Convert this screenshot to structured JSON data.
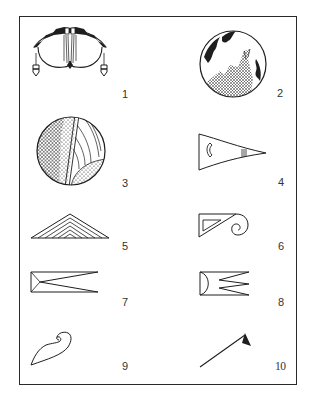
{
  "plate": {
    "figures": [
      {
        "number": "1",
        "motif": "winged-bird-motif"
      },
      {
        "number": "2",
        "motif": "circle-feather-hatched-motif"
      },
      {
        "number": "3",
        "motif": "quartered-circle-textured-motif"
      },
      {
        "number": "4",
        "motif": "tapered-pennant-motif"
      },
      {
        "number": "5",
        "motif": "nested-chevron-triangle-motif"
      },
      {
        "number": "6",
        "motif": "triangle-scroll-motif"
      },
      {
        "number": "7",
        "motif": "forked-rectangle-motif"
      },
      {
        "number": "8",
        "motif": "semicircle-zigzag-motif"
      },
      {
        "number": "9",
        "motif": "hook-curl-motif"
      },
      {
        "number": "10",
        "motif": "line-flag-motif"
      }
    ]
  },
  "colors": {
    "ink": "#1e1e1e",
    "border": "#2a2a2a",
    "paper": "#ffffff"
  }
}
